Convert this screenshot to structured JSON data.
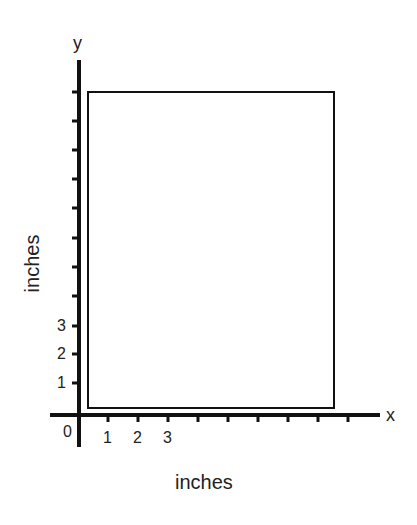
{
  "diagram": {
    "axes": {
      "x_name": "x",
      "y_name": "y",
      "origin_label": "0",
      "x_unit_label": "inches",
      "y_unit_label": "inches",
      "x_tick_labels": [
        "1",
        "2",
        "3"
      ],
      "y_tick_labels": [
        "1",
        "2",
        "3"
      ],
      "x_tick_count": 9,
      "y_tick_count": 11
    },
    "shape": {
      "type": "rectangle",
      "description": "Rectangle drawn on coordinate grid"
    },
    "colors": {
      "line": "#111111",
      "background": "#ffffff"
    }
  }
}
